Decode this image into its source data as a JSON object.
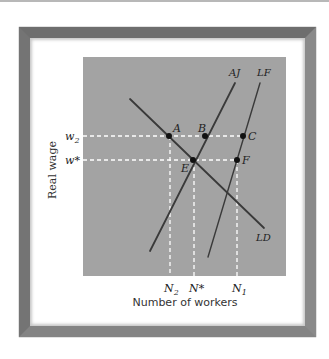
{
  "diagram": {
    "y_axis_label": "Real wage",
    "x_axis_label": "Number of workers",
    "y_ticks": [
      {
        "id": "w2",
        "label": "w",
        "sub": "2"
      },
      {
        "id": "wstar",
        "label": "w*",
        "sub": ""
      }
    ],
    "x_ticks": [
      {
        "id": "N2",
        "label": "N",
        "sub": "2"
      },
      {
        "id": "Nstar",
        "label": "N*",
        "sub": ""
      },
      {
        "id": "N1",
        "label": "N",
        "sub": "1"
      }
    ],
    "curves": [
      {
        "id": "LD",
        "label": "LD",
        "description": "Labor demand"
      },
      {
        "id": "AJ",
        "label": "AJ",
        "description": "Accepted jobs"
      },
      {
        "id": "LF",
        "label": "LF",
        "description": "Labor force"
      }
    ],
    "points": [
      {
        "label": "A"
      },
      {
        "label": "B"
      },
      {
        "label": "C"
      },
      {
        "label": "E"
      },
      {
        "label": "F"
      }
    ],
    "colors": {
      "plot_background": "#a3a3a3",
      "curve": "#3a3a3a",
      "guide_lines": "#ffffff",
      "frame": "#7a7a7a"
    }
  }
}
